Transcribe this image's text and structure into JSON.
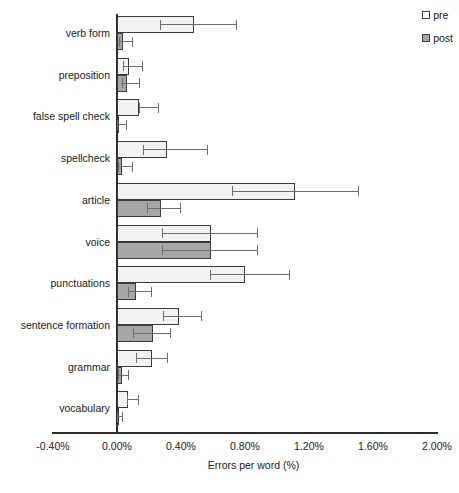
{
  "chart_data": {
    "type": "bar",
    "orientation": "horizontal",
    "title": "",
    "xlabel": "Errors per word (%)",
    "ylabel": "",
    "xlim": [
      -0.4,
      2.0
    ],
    "xticks": [
      "-0.40%",
      "0.00%",
      "0.40%",
      "0.80%",
      "1.20%",
      "1.60%",
      "2.00%"
    ],
    "xtick_values": [
      -0.4,
      0.0,
      0.4,
      0.8,
      1.2,
      1.6,
      2.0
    ],
    "grid": false,
    "legend_position": "top-right",
    "categories": [
      "verb form",
      "preposition",
      "false spell check",
      "spellcheck",
      "article",
      "voice",
      "punctuations",
      "sentence formation",
      "grammar",
      "vocabulary"
    ],
    "series": [
      {
        "name": "pre",
        "color": "#f2f2f2",
        "values": [
          0.48,
          0.075,
          0.14,
          0.31,
          1.11,
          0.59,
          0.8,
          0.39,
          0.22,
          0.07
        ],
        "err_low": [
          0.27,
          0.04,
          0.135,
          0.165,
          0.72,
          0.28,
          0.58,
          0.29,
          0.12,
          0.065
        ],
        "err_high": [
          0.75,
          0.16,
          0.26,
          0.57,
          1.51,
          0.88,
          1.08,
          0.53,
          0.32,
          0.14
        ]
      },
      {
        "name": "post",
        "color": "#a6a6a6",
        "values": [
          0.04,
          0.06,
          0.01,
          0.03,
          0.275,
          0.59,
          0.12,
          0.225,
          0.03,
          0.01
        ],
        "err_low": [
          0.01,
          0.03,
          0.0,
          0.005,
          0.185,
          0.28,
          0.07,
          0.1,
          0.005,
          0.0
        ],
        "err_high": [
          0.1,
          0.145,
          0.06,
          0.1,
          0.4,
          0.88,
          0.22,
          0.34,
          0.075,
          0.04
        ]
      }
    ]
  },
  "legend": {
    "entries": [
      {
        "label": "pre",
        "swatch": "pre-swatch-icon"
      },
      {
        "label": "post",
        "swatch": "post-swatch-icon"
      }
    ]
  },
  "axis": {
    "x_title": "Errors per word (%)"
  }
}
